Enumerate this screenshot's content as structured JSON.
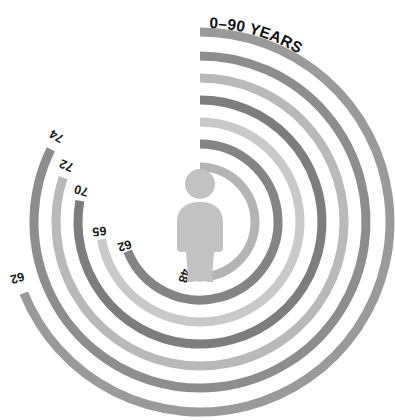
{
  "chart_data": {
    "type": "bar",
    "subtype": "radial-bar",
    "title": "0–90 YEARS",
    "xlabel": "",
    "ylabel": "",
    "scale_min": 0,
    "scale_max": 90,
    "units": "years",
    "grid": false,
    "legend": false,
    "start_angle_deg": 0,
    "direction": "clockwise",
    "categories": [
      "ring-1",
      "ring-2",
      "ring-3",
      "ring-4",
      "ring-5",
      "ring-6",
      "ring-7"
    ],
    "values": [
      48,
      62,
      65,
      70,
      72,
      74,
      62
    ],
    "labels": [
      "48",
      "62",
      "65",
      "70",
      "72",
      "74",
      "62"
    ],
    "colors": [
      "#b4b4b4",
      "#848484",
      "#c9c9c9",
      "#7d7d7d",
      "#b9b9b9",
      "#8d8d8d",
      "#9a9a9a"
    ],
    "rings": [
      {
        "index": 1,
        "label": "48",
        "value": 48,
        "radius": 55,
        "color": "#b4b4b4",
        "position": "innermost"
      },
      {
        "index": 2,
        "label": "62",
        "value": 62,
        "radius": 78,
        "color": "#848484",
        "position": "inner"
      },
      {
        "index": 3,
        "label": "65",
        "value": 65,
        "radius": 100,
        "color": "#c9c9c9",
        "position": "middle-inner"
      },
      {
        "index": 4,
        "label": "70",
        "value": 70,
        "radius": 122,
        "color": "#7d7d7d",
        "position": "middle"
      },
      {
        "index": 5,
        "label": "72",
        "value": 72,
        "radius": 144,
        "color": "#b9b9b9",
        "position": "middle-outer"
      },
      {
        "index": 6,
        "label": "74",
        "value": 74,
        "radius": 166,
        "color": "#8d8d8d",
        "position": "outer"
      },
      {
        "index": 7,
        "label": "62",
        "value": 62,
        "radius": 190,
        "color": "#9a9a9a",
        "position": "outermost"
      }
    ]
  },
  "center": {
    "icon": "person-figure-icon",
    "color": "#c2c2c2"
  },
  "canvas": {
    "background": "#ffffff",
    "width": 395,
    "height": 420
  }
}
